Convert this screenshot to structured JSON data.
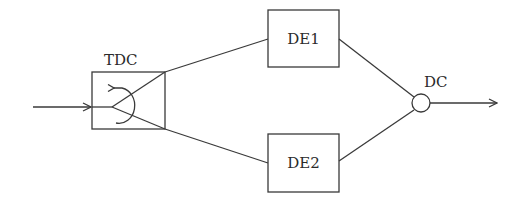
{
  "diagram": {
    "type": "block-diagram",
    "nodes": {
      "tdc": {
        "label": "TDC"
      },
      "de1": {
        "label": "DE1"
      },
      "de2": {
        "label": "DE2"
      },
      "dc": {
        "label": "DC"
      }
    },
    "edges": [
      {
        "from": "input",
        "to": "tdc"
      },
      {
        "from": "tdc",
        "to": "de1"
      },
      {
        "from": "tdc",
        "to": "de2"
      },
      {
        "from": "de1",
        "to": "dc"
      },
      {
        "from": "de2",
        "to": "dc"
      },
      {
        "from": "dc",
        "to": "output"
      }
    ],
    "colors": {
      "stroke": "#3a3a3a",
      "text": "#2a2a2a",
      "background": "#ffffff"
    }
  }
}
